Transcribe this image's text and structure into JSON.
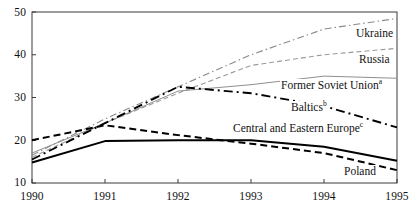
{
  "chart_data": {
    "type": "line",
    "title": "",
    "subtitle": "",
    "xlabel": "",
    "ylabel": "",
    "x": [
      1990,
      1991,
      1992,
      1993,
      1994,
      1995
    ],
    "xticklabels": [
      "1990",
      "1991",
      "1992",
      "1993",
      "1994",
      "1995"
    ],
    "yticks": [
      10,
      20,
      30,
      40,
      50
    ],
    "yticklabels": [
      "10",
      "20",
      "30",
      "40",
      "50"
    ],
    "xlim": [
      1990,
      1995
    ],
    "ylim": [
      10,
      50
    ],
    "grid": false,
    "legend": "inline-labels",
    "series": [
      {
        "name": "Ukraine",
        "label": "Ukraine",
        "footnote": "",
        "style": "dash-dot",
        "color": "#8a8a8a",
        "width": 1.1,
        "values": [
          16.5,
          25.0,
          32.5,
          40.0,
          46.0,
          48.5
        ],
        "label_x": 1994.35,
        "label_y": 44.0
      },
      {
        "name": "Russia",
        "label": "Russia",
        "footnote": "",
        "style": "dashed",
        "color": "#9a9a9a",
        "width": 1.1,
        "values": [
          16.0,
          24.0,
          31.0,
          37.5,
          40.0,
          41.5
        ],
        "label_x": 1994.35,
        "label_y": 38.0
      },
      {
        "name": "Former Soviet Union",
        "label": "Former Soviet Union",
        "footnote": "a",
        "style": "solid-thin",
        "color": "#8f8f8f",
        "width": 1.0,
        "values": [
          17.0,
          24.0,
          31.5,
          33.0,
          35.0,
          34.5
        ],
        "label_x": 1992.6,
        "label_y": 31.2
      },
      {
        "name": "Baltics",
        "label": "Baltics",
        "footnote": "b",
        "style": "dash-dot-heavy",
        "color": "#000000",
        "width": 1.9,
        "values": [
          15.5,
          24.0,
          32.5,
          31.0,
          28.0,
          23.0
        ],
        "label_x": 1992.45,
        "label_y": 28.2
      },
      {
        "name": "Central and Eastern Europe",
        "label": "Central and Eastern Europe",
        "footnote": "c",
        "style": "solid-heavy",
        "color": "#000000",
        "width": 2.0,
        "values": [
          14.8,
          19.8,
          20.0,
          20.0,
          18.5,
          15.2
        ],
        "label_x": 1992.35,
        "label_y": 24.0
      },
      {
        "name": "Poland",
        "label": "Poland",
        "footnote": "",
        "style": "dashed-heavy",
        "color": "#000000",
        "width": 2.0,
        "values": [
          20.0,
          23.5,
          21.2,
          19.2,
          17.0,
          13.0
        ],
        "label_x": 1994.1,
        "label_y": 12.6
      }
    ]
  },
  "axes": {
    "left": 32,
    "right": 397,
    "top": 12,
    "bottom": 183
  }
}
